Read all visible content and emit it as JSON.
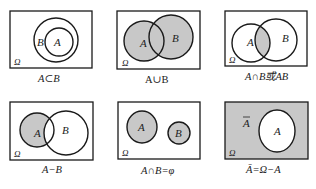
{
  "colors": {
    "shade": "#c8c8c8",
    "stroke": "#1a1a1a",
    "background": "#ffffff"
  },
  "universe_label": "Ω",
  "panels": [
    {
      "id": "subset",
      "caption": "A⊂B",
      "labels": {
        "outer": "B",
        "inner": "A"
      }
    },
    {
      "id": "union",
      "caption": "A∪B",
      "labels": {
        "a": "A",
        "b": "B"
      }
    },
    {
      "id": "intersection",
      "caption": "A∩B或AB",
      "labels": {
        "a": "A",
        "b": "B"
      }
    },
    {
      "id": "difference",
      "caption": "A−B",
      "labels": {
        "a": "A",
        "b": "B"
      }
    },
    {
      "id": "disjoint",
      "caption": "A∩B=φ",
      "labels": {
        "a": "A",
        "b": "B"
      }
    },
    {
      "id": "complement",
      "caption": "Ā=Ω−A",
      "labels": {
        "a": "A",
        "complement": "A"
      }
    }
  ]
}
